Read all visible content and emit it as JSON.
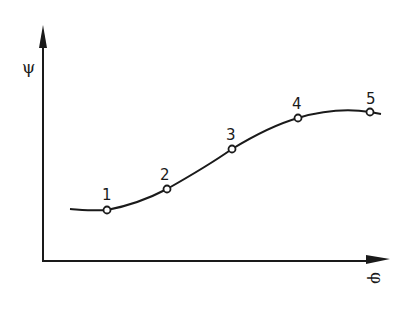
{
  "diagram": {
    "type": "curve-with-points",
    "axes": {
      "y_label": "ψ",
      "x_label": "φ",
      "color": "#1a1a1a"
    },
    "curve": {
      "description": "S-shaped increasing curve through five marked points",
      "color": "#1a1a1a"
    },
    "points": [
      {
        "label": "1"
      },
      {
        "label": "2"
      },
      {
        "label": "3"
      },
      {
        "label": "4"
      },
      {
        "label": "5"
      }
    ]
  }
}
